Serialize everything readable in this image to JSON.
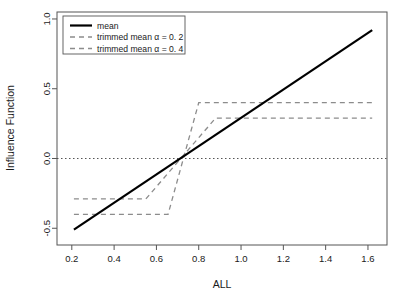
{
  "chart_data": {
    "type": "line",
    "title": "",
    "xlabel": "ALL",
    "ylabel": "Influence Function",
    "xlim": [
      0.13,
      1.69
    ],
    "ylim": [
      -0.62,
      1.05
    ],
    "xticks": [
      0.2,
      0.4,
      0.6,
      0.8,
      1.0,
      1.2,
      1.4,
      1.6
    ],
    "xtick_labels": [
      "0.2",
      "0.4",
      "0.6",
      "0.8",
      "1.0",
      "1.2",
      "1.4",
      "1.6"
    ],
    "yticks": [
      -0.5,
      0.0,
      0.5,
      1.0
    ],
    "ytick_labels": [
      "-0.5",
      "0.0",
      "0.5",
      "1.0"
    ],
    "grid": false,
    "legend_position": "top-left",
    "center": 0.72,
    "reference_line": {
      "name": "zero-reference-line",
      "y": 0.0,
      "style": "dotted",
      "color": "#555555"
    },
    "series": [
      {
        "name": "mean",
        "label": "mean",
        "style": "solid",
        "color": "#000000",
        "width": 2.2,
        "x": [
          0.21,
          1.62
        ],
        "values": [
          -0.51,
          0.92
        ]
      },
      {
        "name": "trimmed mean alpha = 0.2",
        "label": "trimmed mean α = 0. 2",
        "style": "dashed",
        "color": "#8c8c8c",
        "width": 1.3,
        "alpha": 0.2,
        "plateau_low": -0.29,
        "plateau_high": 0.29,
        "x": [
          0.21,
          0.55,
          0.88,
          1.62
        ],
        "values": [
          -0.29,
          -0.29,
          0.29,
          0.29
        ]
      },
      {
        "name": "trimmed mean alpha = 0.4",
        "label": "trimmed mean α = 0. 4",
        "style": "dashed",
        "color": "#8c8c8c",
        "width": 1.3,
        "alpha": 0.4,
        "plateau_low": -0.4,
        "plateau_high": 0.4,
        "x": [
          0.21,
          0.655,
          0.8,
          1.62
        ],
        "values": [
          -0.4,
          -0.4,
          0.4,
          0.4
        ]
      }
    ]
  },
  "legend": {
    "items": [
      {
        "label": "mean"
      },
      {
        "label": "trimmed mean α = 0. 2"
      },
      {
        "label": "trimmed mean α = 0. 4"
      }
    ]
  },
  "axes": {
    "x_title": "ALL",
    "y_title": "Influence Function"
  }
}
